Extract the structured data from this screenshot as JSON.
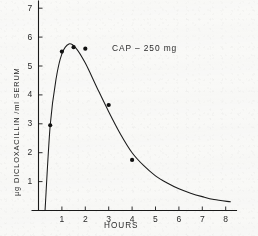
{
  "chart_data": {
    "type": "line",
    "title": "",
    "annotation": "CAP – 250 mg",
    "xlabel": "HOURS",
    "ylabel": "µg DICLOXACILLIN /ml SERUM",
    "xlim": [
      0,
      8.4
    ],
    "ylim": [
      0,
      7.2
    ],
    "grid": false,
    "legend": "none",
    "xticks": [
      1,
      2,
      3,
      4,
      5,
      6,
      7,
      8
    ],
    "xtick_labels": [
      "1",
      "2",
      "3",
      "4",
      "5",
      "6",
      "7",
      "8"
    ],
    "yticks": [
      1,
      2,
      3,
      4,
      5,
      6,
      7
    ],
    "ytick_labels": [
      "1",
      "2",
      "3",
      "4",
      "5",
      "6",
      "7"
    ],
    "series": [
      {
        "name": "Dicloxacillin serum concentration",
        "marker": "filled-circle",
        "points": [
          {
            "x": 0.5,
            "y": 2.95
          },
          {
            "x": 1.0,
            "y": 5.5
          },
          {
            "x": 1.5,
            "y": 5.65
          },
          {
            "x": 2.0,
            "y": 5.6
          },
          {
            "x": 3.0,
            "y": 3.65
          },
          {
            "x": 4.0,
            "y": 1.75
          }
        ]
      },
      {
        "name": "Fitted curve",
        "marker": "none",
        "curve": [
          {
            "x": 0.28,
            "y": 0.0
          },
          {
            "x": 0.5,
            "y": 2.95
          },
          {
            "x": 0.75,
            "y": 4.55
          },
          {
            "x": 1.0,
            "y": 5.42
          },
          {
            "x": 1.3,
            "y": 5.76
          },
          {
            "x": 1.6,
            "y": 5.62
          },
          {
            "x": 2.0,
            "y": 5.1
          },
          {
            "x": 2.5,
            "y": 4.25
          },
          {
            "x": 3.0,
            "y": 3.42
          },
          {
            "x": 3.5,
            "y": 2.65
          },
          {
            "x": 4.0,
            "y": 2.0
          },
          {
            "x": 4.5,
            "y": 1.55
          },
          {
            "x": 5.0,
            "y": 1.2
          },
          {
            "x": 5.5,
            "y": 0.95
          },
          {
            "x": 6.0,
            "y": 0.75
          },
          {
            "x": 6.5,
            "y": 0.6
          },
          {
            "x": 7.0,
            "y": 0.48
          },
          {
            "x": 7.5,
            "y": 0.38
          },
          {
            "x": 8.2,
            "y": 0.3
          }
        ]
      }
    ],
    "colors": {
      "line": "#1a1a1a",
      "marker": "#111111",
      "axis": "#1a1a1a",
      "text": "#2b2b2b",
      "background": "#fbfbfa"
    }
  }
}
